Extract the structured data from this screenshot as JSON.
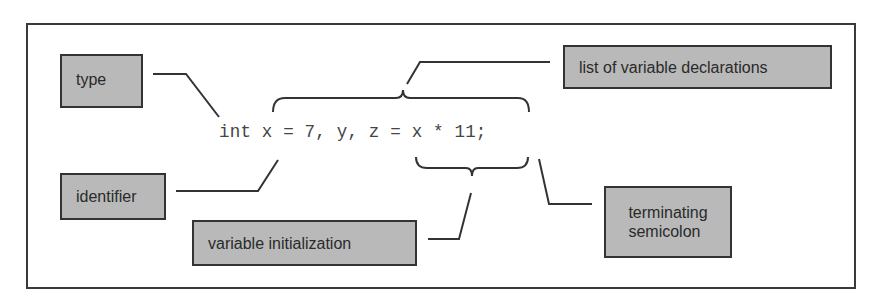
{
  "diagram": {
    "code_statement": "int x = 7, y, z = x * 11;",
    "labels": {
      "type": "type",
      "list_of_declarations": "list of variable declarations",
      "identifier": "identifier",
      "variable_initialization": "variable initialization",
      "terminating_semicolon": "terminating\nsemicolon"
    },
    "annotations": [
      {
        "label": "type",
        "points_to": "int"
      },
      {
        "label": "list of variable declarations",
        "points_to": "x = 7, y, z = x * 11",
        "marker": "brace-above"
      },
      {
        "label": "identifier",
        "points_to": "x"
      },
      {
        "label": "variable initialization",
        "points_to": "= x * 11",
        "marker": "brace-below"
      },
      {
        "label": "terminating semicolon",
        "points_to": ";"
      }
    ],
    "colors": {
      "box_fill": "#b9b9b9",
      "box_border": "#333333",
      "line": "#333333",
      "code_text": "#444444"
    }
  }
}
